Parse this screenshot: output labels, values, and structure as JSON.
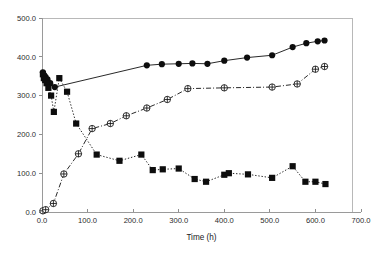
{
  "chart_data": {
    "type": "line",
    "title": "",
    "subtitle": "",
    "xlabel": "Time (h)",
    "ylabel": "",
    "xlim": [
      0.0,
      700.0
    ],
    "ylim": [
      0.0,
      500.0
    ],
    "xticks": [
      0.0,
      100.0,
      200.0,
      300.0,
      400.0,
      500.0,
      600.0,
      700.0
    ],
    "xtick_labels": [
      "0.0",
      "100.0",
      "200.0",
      "300.0",
      "400.0",
      "500.0",
      "600.0",
      "700.0"
    ],
    "yticks": [
      0.0,
      100.0,
      200.0,
      300.0,
      400.0,
      500.0
    ],
    "ytick_labels": [
      "0.0",
      "100.0",
      "200.0",
      "300.0",
      "400.0",
      "500.0"
    ],
    "grid": false,
    "legend": "none",
    "series": [
      {
        "name": "filled-circle-series",
        "marker": "filled-circle",
        "linestyle": "solid",
        "color": "#0d0d0d",
        "x": [
          2,
          5,
          8,
          12,
          18,
          28,
          230,
          263,
          300,
          330,
          363,
          400,
          450,
          505,
          550,
          580,
          605,
          620
        ],
        "y": [
          360,
          352,
          348,
          342,
          332,
          322,
          378,
          381,
          382,
          383,
          382,
          390,
          398,
          404,
          425,
          435,
          440,
          442
        ]
      },
      {
        "name": "open-circle-plus-series",
        "marker": "circle-plus",
        "linestyle": "dashdot",
        "color": "#111111",
        "x": [
          2,
          8,
          25,
          48,
          80,
          110,
          150,
          185,
          230,
          275,
          320,
          400,
          505,
          560,
          600,
          620
        ],
        "y": [
          3,
          6,
          22,
          98,
          150,
          215,
          228,
          248,
          268,
          290,
          318,
          320,
          322,
          330,
          368,
          375
        ]
      },
      {
        "name": "filled-square-series",
        "marker": "filled-square",
        "linestyle": "dotted",
        "color": "#0d0d0d",
        "x": [
          2,
          4,
          7,
          10,
          14,
          20,
          26,
          38,
          55,
          75,
          120,
          170,
          218,
          243,
          265,
          300,
          335,
          360,
          400,
          410,
          452,
          505,
          550,
          578,
          600,
          622
        ],
        "y": [
          355,
          345,
          340,
          332,
          320,
          300,
          258,
          345,
          310,
          228,
          148,
          132,
          148,
          108,
          110,
          112,
          85,
          78,
          96,
          100,
          97,
          88,
          118,
          78,
          78,
          72
        ]
      }
    ],
    "axis_color": "#9a9a9a",
    "frame_color": "#b8b8b8",
    "marker_color": "#0d0d0d"
  },
  "figure": {
    "background": "#ffffff",
    "width": 389,
    "height": 255
  }
}
